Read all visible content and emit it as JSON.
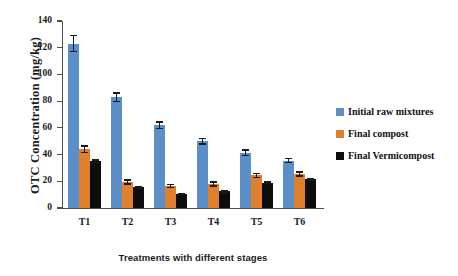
{
  "chart_data": {
    "type": "bar",
    "title": "",
    "xlabel": "Treatments with different stages",
    "ylabel": "OTC Concentration  (mg/kg)",
    "categories": [
      "T1",
      "T2",
      "T3",
      "T4",
      "T5",
      "T6"
    ],
    "ylim": [
      0,
      140
    ],
    "yticks": [
      0,
      20,
      40,
      60,
      80,
      100,
      120,
      140
    ],
    "ytick_labels": [
      "0",
      "20",
      "40",
      "60",
      "80",
      "100",
      "120",
      "140"
    ],
    "grid": false,
    "legend_position": "right",
    "series": [
      {
        "name": "Initial raw mixtures",
        "color": "#5b8fc7",
        "values": [
          123,
          83,
          62,
          50,
          41.5,
          35.5
        ],
        "errors": [
          6,
          3,
          2.5,
          2,
          2,
          1.5
        ]
      },
      {
        "name": "Final compost",
        "color": "#e0802e",
        "values": [
          44,
          19.5,
          16.5,
          18,
          24.5,
          25.5
        ],
        "errors": [
          2.5,
          1.5,
          1,
          1.5,
          1.5,
          1.5
        ]
      },
      {
        "name": "Final Vermicompost",
        "color": "#0d0d0d",
        "values": [
          35,
          15.5,
          10.5,
          12.5,
          19,
          21.5
        ],
        "errors": [
          1,
          0.5,
          0.5,
          0.5,
          0.5,
          0.5
        ]
      }
    ]
  },
  "axes": {
    "y_title": "OTC Concentration  (mg/kg)",
    "x_title": "Treatments with different stages"
  },
  "legend": {
    "items": [
      {
        "label": "Initial raw mixtures",
        "color": "#5b8fc7"
      },
      {
        "label": "Final compost",
        "color": "#e0802e"
      },
      {
        "label": "Final Vermicompost",
        "color": "#0d0d0d"
      }
    ]
  }
}
